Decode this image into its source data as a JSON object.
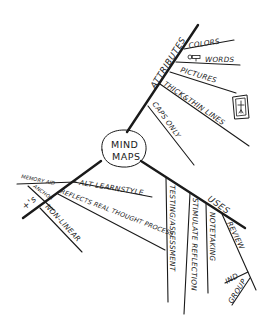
{
  "center": {
    "line1": "MIND",
    "line2": "MAPS"
  },
  "branches": {
    "attributes": {
      "label": "ATTRIBUTES",
      "children": {
        "colors": "COLORS",
        "words": "WORDS",
        "pictures": "PICTURES",
        "thick_thin": "THICK&THIN LINES",
        "caps_only": "CAPS ONLY"
      }
    },
    "uses": {
      "label": "USES",
      "children": {
        "testing": "TESTING/ASSESSMENT",
        "stimulate": "STIMULATE REFLECTION",
        "notetaking": "NOTETAKING",
        "review": "REVIEW",
        "ind": "IND",
        "group": "GROUP"
      }
    },
    "left": {
      "label": "+'s",
      "children": {
        "memory_aid": "MEMORY AID",
        "anchor": "ANCHOR",
        "alt_learn": "ALT LEARNSTYLE",
        "reflects": "REFLECTS REAL THOUGHT PROCESS",
        "non_linear": "NON-LINEAR"
      }
    }
  },
  "icons": {
    "key": "key-icon",
    "picture_frame": "picture-frame-icon"
  }
}
